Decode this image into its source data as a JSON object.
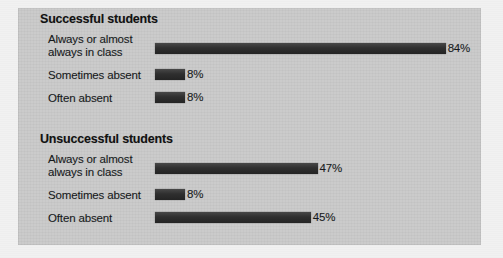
{
  "chart_data": {
    "type": "bar",
    "orientation": "horizontal",
    "title": "",
    "xlabel": "",
    "ylabel": "",
    "xlim": [
      0,
      100
    ],
    "grid": false,
    "legend": false,
    "value_suffix": "%",
    "categories": [
      "Always or almost always in class",
      "Sometimes absent",
      "Often absent"
    ],
    "groups": [
      {
        "name": "Successful students",
        "values": [
          84,
          8,
          8
        ],
        "labels": [
          "84%",
          "8%",
          "8%"
        ]
      },
      {
        "name": "Unsuccessful students",
        "values": [
          47,
          8,
          45
        ],
        "labels": [
          "47%",
          "8%",
          "45%"
        ]
      }
    ]
  },
  "panel": {
    "groups": [
      {
        "title": "Successful students",
        "rows": [
          {
            "label_line1": "Always or almost",
            "label_line2": "always in class",
            "value_label": "84%"
          },
          {
            "label_line1": "Sometimes absent",
            "label_line2": "",
            "value_label": "8%"
          },
          {
            "label_line1": "Often absent",
            "label_line2": "",
            "value_label": "8%"
          }
        ]
      },
      {
        "title": "Unsuccessful students",
        "rows": [
          {
            "label_line1": "Always or almost",
            "label_line2": "always in class",
            "value_label": "47%"
          },
          {
            "label_line1": "Sometimes absent",
            "label_line2": "",
            "value_label": "8%"
          },
          {
            "label_line1": "Often absent",
            "label_line2": "",
            "value_label": "45%"
          }
        ]
      }
    ]
  },
  "colors": {
    "bar": "#2f2f2f",
    "panel_background": "#c9c9c9",
    "page_background": "#f1f1f1",
    "text": "#15181a"
  }
}
